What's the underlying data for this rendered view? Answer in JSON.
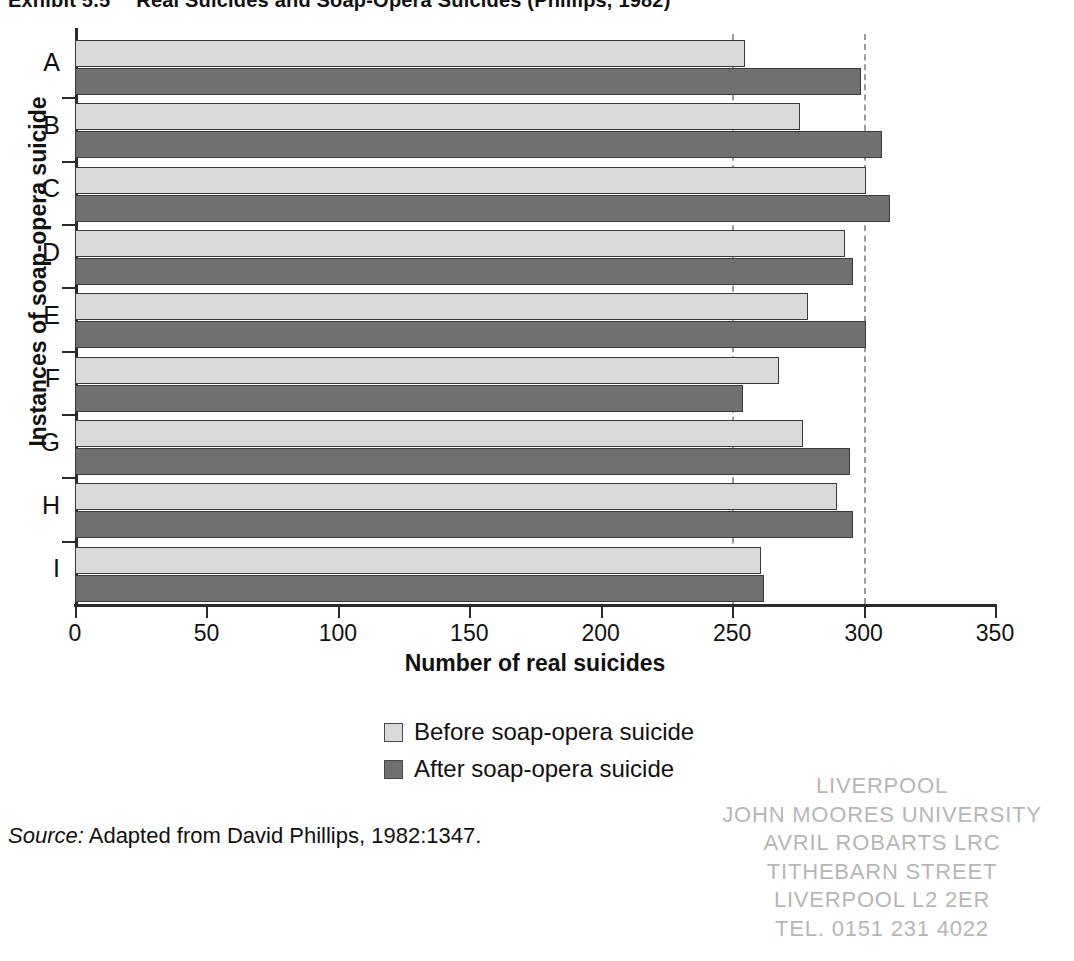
{
  "title": {
    "exhibit": "Exhibit 5.5",
    "text": "Real Suicides and Soap-Opera Suicides (Phillips, 1982)"
  },
  "axes": {
    "xlabel": "Number of real suicides",
    "ylabel": "Instances of soap-opera suicide",
    "xticks": [
      "0",
      "50",
      "100",
      "150",
      "200",
      "250",
      "300",
      "350"
    ]
  },
  "legend": {
    "before": "Before soap-opera suicide",
    "after": "After soap-opera suicide"
  },
  "source": {
    "label": "Source:",
    "text": " Adapted from David Phillips, 1982:1347."
  },
  "stamp": {
    "lines": [
      "LIVERPOOL",
      "JOHN MOORES UNIVERSITY",
      "AVRIL ROBARTS LRC",
      "TITHEBARN STREET",
      "LIVERPOOL L2 2ER",
      "TEL. 0151 231 4022"
    ]
  },
  "colors": {
    "before_fill": "#d9d9d9",
    "after_fill": "#707070",
    "bar_stroke": "#3a3a3a",
    "axis": "#2b2b2b",
    "gridline": "#9a9a9a",
    "stamp": "#9b9b9b"
  },
  "chart_data": {
    "type": "bar",
    "orientation": "horizontal",
    "xlabel": "Number of real suicides",
    "ylabel": "Instances of soap-opera suicide",
    "xlim": [
      0,
      350
    ],
    "xticks": [
      0,
      50,
      100,
      150,
      200,
      250,
      300,
      350
    ],
    "grid": "vertical dashed gridlines at 250 and 300",
    "legend_position": "below chart, centered",
    "categories": [
      "A",
      "B",
      "C",
      "D",
      "E",
      "F",
      "G",
      "H",
      "I"
    ],
    "series": [
      {
        "name": "Before soap-opera suicide",
        "color": "#d9d9d9",
        "values": [
          255,
          276,
          301,
          293,
          279,
          268,
          277,
          290,
          261
        ]
      },
      {
        "name": "After soap-opera suicide",
        "color": "#707070",
        "values": [
          299,
          307,
          310,
          296,
          301,
          254,
          295,
          296,
          262
        ]
      }
    ],
    "gridline_values": [
      250,
      300
    ]
  }
}
